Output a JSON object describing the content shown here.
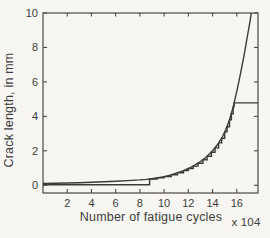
{
  "figure": {
    "background": "#f7f6f3",
    "line_color": "#3a3a3a",
    "axis_color": "#4a4a4a",
    "text_color": "#3d3d3d"
  },
  "chart_data": {
    "type": "line",
    "title": "",
    "xlabel": "Number of fatigue cycles",
    "xlabel_multiplier": "x 104",
    "ylabel": "Crack length, in mm",
    "xlim": [
      0,
      17.75
    ],
    "ylim": [
      -0.45,
      10
    ],
    "xticks": [
      2,
      4,
      6,
      8,
      10,
      12,
      14,
      16
    ],
    "yticks": [
      0,
      2,
      4,
      6,
      8,
      10
    ],
    "grid": false,
    "legend": null,
    "series": [
      {
        "name": "smooth-crack-growth-curve",
        "style": "line",
        "points": [
          [
            0,
            0.1
          ],
          [
            1,
            0.115
          ],
          [
            2,
            0.13
          ],
          [
            3,
            0.15
          ],
          [
            4,
            0.17
          ],
          [
            5,
            0.2
          ],
          [
            6,
            0.23
          ],
          [
            7,
            0.27
          ],
          [
            8,
            0.31
          ],
          [
            8.5,
            0.34
          ],
          [
            9,
            0.38
          ],
          [
            9.5,
            0.44
          ],
          [
            10,
            0.5
          ],
          [
            10.5,
            0.59
          ],
          [
            11,
            0.7
          ],
          [
            11.5,
            0.82
          ],
          [
            12,
            0.97
          ],
          [
            12.5,
            1.15
          ],
          [
            13,
            1.38
          ],
          [
            13.5,
            1.65
          ],
          [
            14,
            2.0
          ],
          [
            14.4,
            2.35
          ],
          [
            14.8,
            2.8
          ],
          [
            15.1,
            3.25
          ],
          [
            15.4,
            3.8
          ],
          [
            15.7,
            4.55
          ],
          [
            16.0,
            5.45
          ],
          [
            16.3,
            6.45
          ],
          [
            16.6,
            7.55
          ],
          [
            16.9,
            8.75
          ],
          [
            17.1,
            9.55
          ],
          [
            17.2,
            10.0
          ]
        ]
      },
      {
        "name": "observed-step-path",
        "style": "step",
        "start": [
          0,
          0.03
        ],
        "jumps": [
          [
            8.8,
            0.36
          ],
          [
            9.4,
            0.43
          ],
          [
            10.0,
            0.5
          ],
          [
            10.6,
            0.61
          ],
          [
            11.1,
            0.72
          ],
          [
            11.6,
            0.85
          ],
          [
            12.0,
            0.97
          ],
          [
            12.4,
            1.11
          ],
          [
            12.8,
            1.28
          ],
          [
            13.2,
            1.48
          ],
          [
            13.55,
            1.68
          ],
          [
            13.9,
            1.91
          ],
          [
            14.2,
            2.17
          ],
          [
            14.5,
            2.46
          ],
          [
            14.75,
            2.73
          ],
          [
            15.0,
            3.1
          ],
          [
            15.2,
            3.4
          ],
          [
            15.4,
            3.8
          ],
          [
            15.55,
            4.15
          ],
          [
            15.7,
            4.55
          ],
          [
            15.78,
            4.78
          ]
        ],
        "extend_to_x": 17.75
      }
    ]
  }
}
